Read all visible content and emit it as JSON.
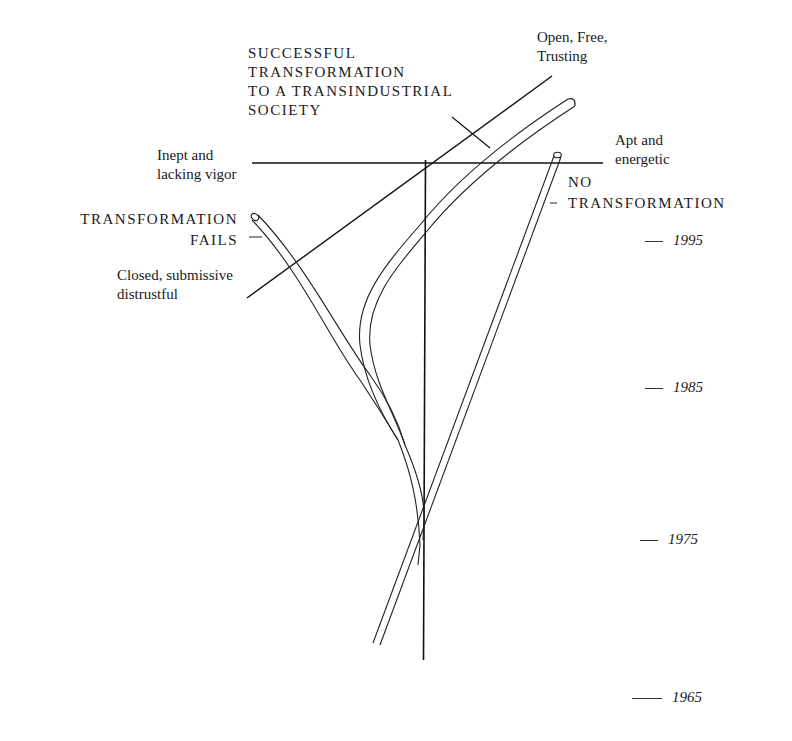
{
  "diagram": {
    "type": "branching-scenario-timeline",
    "labels": {
      "success": [
        "SUCCESSFUL",
        "TRANSFORMATION",
        "TO A TRANSINDUSTRIAL",
        "SOCIETY"
      ],
      "open_free": [
        "Open, Free,",
        "Trusting"
      ],
      "inept": [
        "Inept and",
        "lacking vigor"
      ],
      "apt": [
        "Apt and",
        "energetic"
      ],
      "no_transformation": [
        "NO",
        "TRANSFORMATION"
      ],
      "transformation_fails": [
        "TRANSFORMATION",
        "FAILS"
      ],
      "closed": [
        "Closed, submissive",
        "distrustful"
      ]
    },
    "timeline": {
      "years": [
        "1995",
        "1985",
        "1975",
        "1965"
      ]
    },
    "paths": [
      {
        "name": "successful-transformation-path",
        "ends_at": "Open, Free, Trusting"
      },
      {
        "name": "transformation-fails-path",
        "ends_at": "TRANSFORMATION FAILS"
      },
      {
        "name": "no-transformation-path",
        "ends_at": "NO TRANSFORMATION"
      }
    ],
    "axes": [
      {
        "name": "vigor-axis",
        "from": "Inept and lacking vigor",
        "to": "Apt and energetic"
      },
      {
        "name": "openness-axis",
        "from": "Closed, submissive distrustful",
        "to": "Open, Free, Trusting"
      },
      {
        "name": "time-axis",
        "from": "1965",
        "to": "1995"
      }
    ]
  }
}
